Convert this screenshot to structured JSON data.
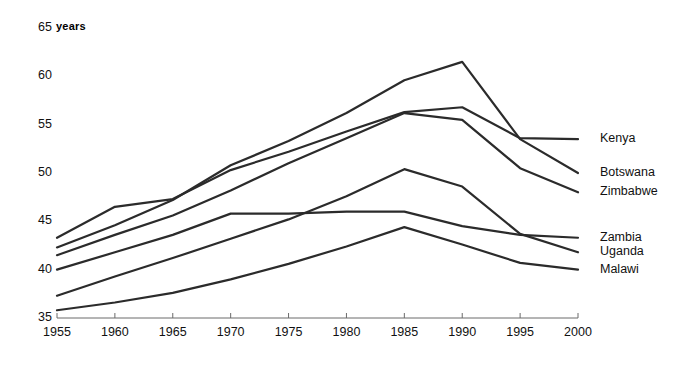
{
  "chart_data": {
    "type": "line",
    "title": "",
    "xlabel": "",
    "ylabel": "years",
    "x": [
      1955,
      1960,
      1965,
      1970,
      1975,
      1980,
      1985,
      1990,
      1995,
      2000
    ],
    "xlim": [
      1955,
      2000
    ],
    "ylim": [
      35,
      65
    ],
    "yticks": [
      35,
      40,
      45,
      50,
      55,
      60,
      65
    ],
    "xticks": [
      1955,
      1960,
      1965,
      1970,
      1975,
      1980,
      1985,
      1990,
      1995,
      2000
    ],
    "grid": false,
    "legend_position": "right-inline",
    "line_color": "#2b2b2b",
    "series": [
      {
        "name": "Kenya",
        "values": [
          43.3,
          46.5,
          47.3,
          50.3,
          52.2,
          54.3,
          56.3,
          56.8,
          53.6,
          53.5
        ]
      },
      {
        "name": "Botswana",
        "values": [
          42.3,
          44.6,
          47.2,
          50.8,
          53.3,
          56.2,
          59.6,
          61.5,
          53.5,
          50.0
        ]
      },
      {
        "name": "Zimbabwe",
        "values": [
          41.5,
          43.6,
          45.6,
          48.2,
          51.0,
          53.6,
          56.2,
          55.5,
          50.5,
          48.0
        ]
      },
      {
        "name": "Zambia",
        "values": [
          40.0,
          41.8,
          43.6,
          45.8,
          45.8,
          46.0,
          46.0,
          44.5,
          43.6,
          43.3
        ]
      },
      {
        "name": "Uganda",
        "values": [
          37.3,
          39.3,
          41.2,
          43.2,
          45.2,
          47.6,
          50.4,
          48.6,
          43.7,
          41.8
        ]
      },
      {
        "name": "Malawi",
        "values": [
          35.8,
          36.6,
          37.6,
          39.0,
          40.6,
          42.4,
          44.4,
          42.6,
          40.7,
          40.0
        ]
      }
    ]
  },
  "axis": {
    "unit_label": "years"
  }
}
